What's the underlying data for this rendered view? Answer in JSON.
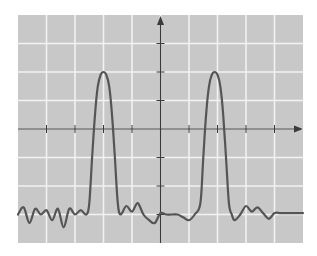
{
  "figure": {
    "colors": {
      "background": "#ffffff",
      "plot_area": "#c8c8c8",
      "grid": "#f2f2f2",
      "axis": "#3a3a3a",
      "signal": "#555555"
    }
  },
  "chart_data": {
    "type": "line",
    "title": "",
    "xlabel": "",
    "ylabel": "",
    "grid": true,
    "legend": null,
    "x_grid_divisions": 10,
    "y_grid_divisions": 8,
    "xlim": [
      -5,
      5
    ],
    "ylim": [
      -4,
      4
    ],
    "axes": {
      "x_arrow": true,
      "y_arrow": true,
      "origin": [
        0,
        0
      ]
    },
    "tick_labels": {
      "x": [],
      "y": []
    },
    "series": [
      {
        "name": "signal",
        "description": "Baseline near y=-3 with small oscillations (ringing); two tall pulses centered at x=-2 and x=+2 reaching y=+2",
        "x": [
          -5.0,
          -4.8,
          -4.6,
          -4.4,
          -4.2,
          -4.0,
          -3.8,
          -3.6,
          -3.4,
          -3.2,
          -3.0,
          -2.8,
          -2.6,
          -2.5,
          -2.4,
          -2.3,
          -2.2,
          -2.1,
          -2.0,
          -1.9,
          -1.8,
          -1.7,
          -1.6,
          -1.5,
          -1.4,
          -1.2,
          -1.0,
          -0.8,
          -0.6,
          -0.4,
          -0.2,
          0.0,
          0.2,
          0.4,
          0.6,
          0.8,
          1.0,
          1.2,
          1.4,
          1.5,
          1.6,
          1.7,
          1.8,
          1.9,
          2.0,
          2.1,
          2.2,
          2.3,
          2.4,
          2.5,
          2.6,
          2.8,
          3.0,
          3.2,
          3.4,
          3.6,
          3.8,
          4.0,
          4.2,
          4.4,
          4.6,
          4.8,
          5.0
        ],
        "y": [
          -3.0,
          -2.75,
          -3.3,
          -2.8,
          -3.0,
          -2.85,
          -3.2,
          -2.8,
          -3.45,
          -2.8,
          -3.0,
          -2.85,
          -3.0,
          -2.6,
          -1.0,
          0.5,
          1.5,
          1.9,
          2.0,
          1.9,
          1.5,
          0.5,
          -1.0,
          -2.6,
          -3.0,
          -2.7,
          -2.9,
          -2.6,
          -3.0,
          -3.2,
          -3.3,
          -2.95,
          -3.0,
          -3.0,
          -3.0,
          -3.1,
          -3.2,
          -3.0,
          -2.6,
          -1.0,
          0.5,
          1.5,
          1.9,
          2.0,
          1.9,
          1.5,
          0.5,
          -1.0,
          -2.6,
          -3.0,
          -3.2,
          -3.0,
          -2.7,
          -2.9,
          -2.75,
          -2.95,
          -3.15,
          -2.95,
          -2.95,
          -2.95,
          -2.95,
          -2.95,
          -2.95
        ]
      }
    ]
  }
}
